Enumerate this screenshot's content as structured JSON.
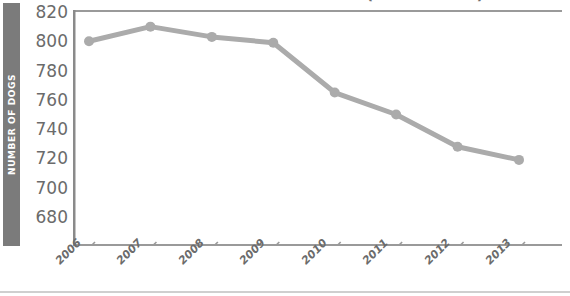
{
  "chart_data": {
    "type": "line",
    "title": "NUMBER OF DOGS IN SHELTERS (2006 - 2013)",
    "xlabel": "",
    "ylabel": "NUMBER OF DOGS",
    "categories": [
      "2006",
      "2007",
      "2008",
      "2009",
      "2010",
      "2011",
      "2012",
      "2013"
    ],
    "values": [
      800,
      810,
      803,
      799,
      765,
      750,
      728,
      719
    ],
    "series": [
      {
        "name": "Number of dogs",
        "values": [
          800,
          810,
          803,
          799,
          765,
          750,
          728,
          719
        ]
      }
    ],
    "ylim": [
      670,
      820
    ],
    "yticks": [
      820,
      800,
      780,
      760,
      740,
      720,
      700,
      680
    ],
    "ytick_labels": [
      "820",
      "800",
      "780",
      "760",
      "740",
      "720",
      "700",
      "680"
    ],
    "xtick_labels": [
      "2006",
      "2007",
      "2008",
      "2009",
      "2010",
      "2011",
      "2012",
      "2013"
    ],
    "grid": false,
    "legend": "none",
    "line_color": "#ababab",
    "marker_color": "#ababab",
    "axis_color": "#8a8a8a",
    "tick_text_color": "#6b6b6b",
    "ylabel_bar_color": "#7b7b7b",
    "ylabel_text_color": "#ffffff",
    "background": "#ffffff"
  }
}
